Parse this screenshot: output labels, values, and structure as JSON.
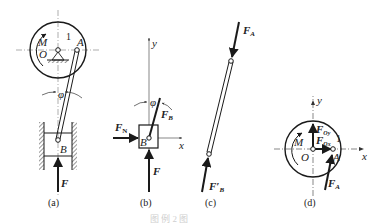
{
  "figure": {
    "caption": "图  例  2 图",
    "panels": [
      {
        "id": "a",
        "label": "(a)",
        "labels": {
          "moment": "M",
          "pivot_O": "O",
          "point_A": "A",
          "number": "1",
          "angle": "φ",
          "point_B": "B",
          "force": "F"
        }
      },
      {
        "id": "b",
        "label": "(b)",
        "labels": {
          "y_axis": "y",
          "x_axis": "x",
          "angle": "φ",
          "normal_force": "F",
          "normal_force_sub": "N",
          "rod_force": "F",
          "rod_force_sub": "B",
          "point_B": "B",
          "force": "F"
        }
      },
      {
        "id": "c",
        "label": "(c)",
        "labels": {
          "force_A": "F",
          "force_A_sub": "A",
          "force_B": "F′",
          "force_B_sub": "B"
        }
      },
      {
        "id": "d",
        "label": "(d)",
        "labels": {
          "y_axis": "y",
          "x_axis": "x",
          "moment": "M",
          "pivot_O": "O",
          "point_A": "A",
          "force_Oy": "F",
          "force_Oy_sub": "Oy",
          "force_Ox": "F",
          "force_Ox_sub": "Ox",
          "number": "1",
          "force_A": "F",
          "force_A_sub": "A"
        }
      }
    ]
  },
  "colors": {
    "ink": "#1a1a1a",
    "axis": "#555555",
    "background": "#ffffff"
  }
}
